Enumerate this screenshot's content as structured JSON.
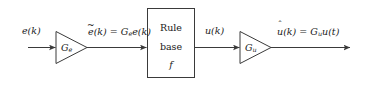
{
  "diagram": {
    "type": "block-diagram",
    "background_color": "#ffffff",
    "line_color": "#3a3a3a",
    "text_color": "#1a1a1a",
    "input_signal_label": "e(k)",
    "input_gain_label": "G",
    "input_gain_subscript": "e",
    "input_gain_equation_lhs_base": "e",
    "input_gain_equation_accent": "~",
    "input_gain_equation": "ẽ(k) = Gₑe(k)",
    "input_eq_part1": "(k) = G",
    "input_eq_sub": "e",
    "input_eq_part2": "e(k)",
    "rule_box_line1": "Rule",
    "rule_box_line2": "base",
    "rule_box_line3": "f",
    "mid_signal_label": "u(k)",
    "output_gain_label": "G",
    "output_gain_subscript": "u",
    "output_eq_base": "u",
    "output_eq_accent": "ˆ",
    "output_equation": "û(k) = Gᵤu(t)",
    "output_eq_part1": "(k) = G",
    "output_eq_sub": "u",
    "output_eq_part2": "u(t)"
  }
}
